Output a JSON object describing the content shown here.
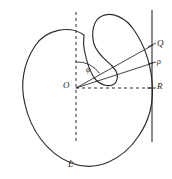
{
  "figure": {
    "stroke_color": "#2b2b2b",
    "background_color": "#ffffff",
    "labels": {
      "origin": "O",
      "angle": "φ",
      "point_q": "Q",
      "point_p": "ρ",
      "point_r": "R",
      "curve": "L"
    },
    "curve": {
      "name": "L",
      "type": "closed-non-convex-curve",
      "path": "M 84 35 C 70 26 47 30 36 46 C 24 63 21 84 25 103 C 29 127 45 152 70 163 C 96 174 122 160 138 138 C 150 121 154 101 152 82 C 150 62 143 44 134 31 C 126 19 113 12 103 16 C 94 20 92 32 95 43 C 98 53 106 59 112 65 C 117 70 119 76 116 81 C 112 87 103 86 97 80 C 90 73 87 60 84 49 C 82 42 84 38 84 35 Z"
    },
    "axes": {
      "vertical_dashed": {
        "x": 76,
        "y1": 12,
        "y2": 141,
        "style": "dashed"
      },
      "horizontal_dashed": {
        "y": 88,
        "x1": 76,
        "x2": 152,
        "style": "dashed"
      },
      "support_line": {
        "x": 152,
        "y1": 10,
        "y2": 142,
        "style": "solid"
      }
    },
    "rays": [
      {
        "name": "ray-to-Q",
        "x1": 76,
        "y1": 88,
        "x2": 153,
        "y2": 45
      },
      {
        "name": "ray-to-P",
        "x1": 76,
        "y1": 88,
        "x2": 153,
        "y2": 63
      }
    ],
    "angle_arc": {
      "name": "phi-arc",
      "center_x": 76,
      "center_y": 88,
      "radius": 26,
      "path": "M 76 62 A 26 26 0 0 1 99 74"
    },
    "points": [
      {
        "name": "Q",
        "x": 153,
        "y": 45
      },
      {
        "name": "P",
        "x": 153,
        "y": 63
      },
      {
        "name": "R",
        "x": 152,
        "y": 88
      },
      {
        "name": "O",
        "x": 76,
        "y": 88
      }
    ]
  }
}
